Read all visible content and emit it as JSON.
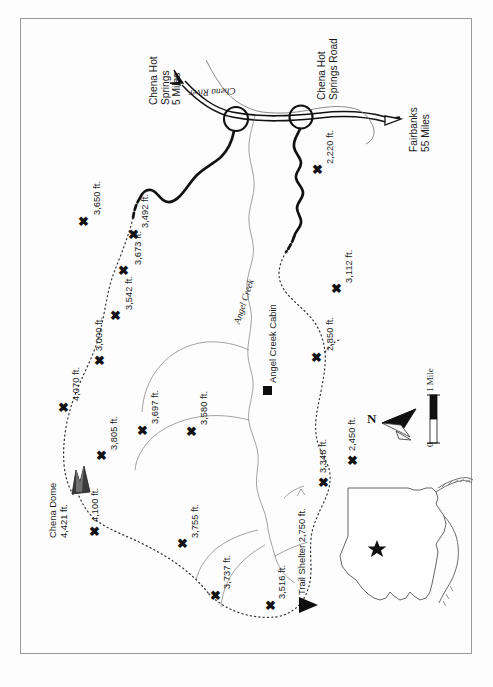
{
  "map": {
    "title": "Chena Dome Trail Map",
    "orientation_note": "rotated 90 degrees; north points to the right",
    "border_color": "#9a9a9a",
    "paper_color": "#fdfdfd",
    "ink_color": "#1a1a1a"
  },
  "roads": [
    {
      "name": "Chena Hot Springs Road",
      "label": "Chena Hot Springs Road"
    }
  ],
  "destinations": [
    {
      "name": "chena-hot-springs",
      "line1": "Chena Hot",
      "line2": "Springs",
      "line3": "5 Miles",
      "full": "Chena Hot Springs 5 Miles"
    },
    {
      "name": "fairbanks",
      "line1": "Fairbanks",
      "line2": "55 Miles",
      "full": "Fairbanks 55 Miles"
    }
  ],
  "hydrography": [
    {
      "name": "chena-river",
      "label": "Chena River"
    },
    {
      "name": "angel-creek",
      "label": "Angel Creek"
    }
  ],
  "facilities": [
    {
      "name": "angel-creek-cabin",
      "label": "Angel Creek Cabin",
      "symbol": "filled-square"
    },
    {
      "name": "trail-shelter",
      "label": "Trail Shelter 2,750 ft.",
      "elevation_ft": 2750,
      "symbol": "filled-triangle"
    }
  ],
  "summits": [
    {
      "name": "chena-dome",
      "line1": "Chena Dome",
      "line2": "4,421 ft.",
      "label": "Chena Dome 4,421 ft.",
      "elevation_ft": 4421,
      "symbol": "mountain-peak"
    }
  ],
  "elevation_points": [
    {
      "label": "3,650 ft.",
      "value": 3650
    },
    {
      "label": "3,492 ft.",
      "value": 3492
    },
    {
      "label": "3,673 ft.",
      "value": 3673
    },
    {
      "label": "3,542 ft.",
      "value": 3542
    },
    {
      "label": "3,000 ft.",
      "value": 3000
    },
    {
      "label": "4,070 ft.",
      "value": 4070
    },
    {
      "label": "3,805 ft.",
      "value": 3805
    },
    {
      "label": "3,697 ft.",
      "value": 3697
    },
    {
      "label": "3,580 ft.",
      "value": 3580
    },
    {
      "label": "4,100 ft.",
      "value": 4100
    },
    {
      "label": "3,755 ft.",
      "value": 3755
    },
    {
      "label": "3,737 ft.",
      "value": 3737
    },
    {
      "label": "3,516 ft.",
      "value": 3516
    },
    {
      "label": "2,220 ft.",
      "value": 2220
    },
    {
      "label": "3,112 ft.",
      "value": 3112
    },
    {
      "label": "2,850 ft.",
      "value": 2850
    },
    {
      "label": "2,450 ft.",
      "value": 2450
    },
    {
      "label": "3,348 ft.",
      "value": 3348
    }
  ],
  "scale_bar": {
    "name": "scale-bar",
    "min_label": "0",
    "max_label": "1 Mile",
    "units": "Mile"
  },
  "compass": {
    "name": "north-arrow",
    "label": "N"
  },
  "inset": {
    "name": "alaska-locator-inset",
    "region": "Alaska",
    "marker": "star"
  }
}
